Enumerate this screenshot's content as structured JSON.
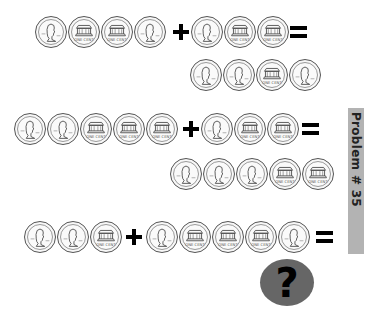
{
  "title_label": "Problem # 35",
  "coin_types": {
    "H": "penny-heads (Lincoln portrait)",
    "T": "penny-tails (Lincoln Memorial, ONE CENT)"
  },
  "problems": [
    {
      "left": [
        "H",
        "T",
        "T",
        "H"
      ],
      "operator": "+",
      "right": [
        "H",
        "T",
        "T"
      ],
      "equals": "=",
      "answer": [
        "H",
        "H",
        "T",
        "H"
      ]
    },
    {
      "left": [
        "H",
        "H",
        "T",
        "T",
        "T"
      ],
      "operator": "+",
      "right": [
        "H",
        "T",
        "T"
      ],
      "equals": "=",
      "answer": [
        "H",
        "H",
        "H",
        "T",
        "T"
      ]
    },
    {
      "left": [
        "H",
        "H",
        "T"
      ],
      "operator": "+",
      "right": [
        "H",
        "T",
        "T",
        "T",
        "H"
      ],
      "equals": "=",
      "answer_placeholder": "?"
    }
  ],
  "colors": {
    "mystery_circle": "#666666",
    "label_bar": "#b3b3b3"
  }
}
